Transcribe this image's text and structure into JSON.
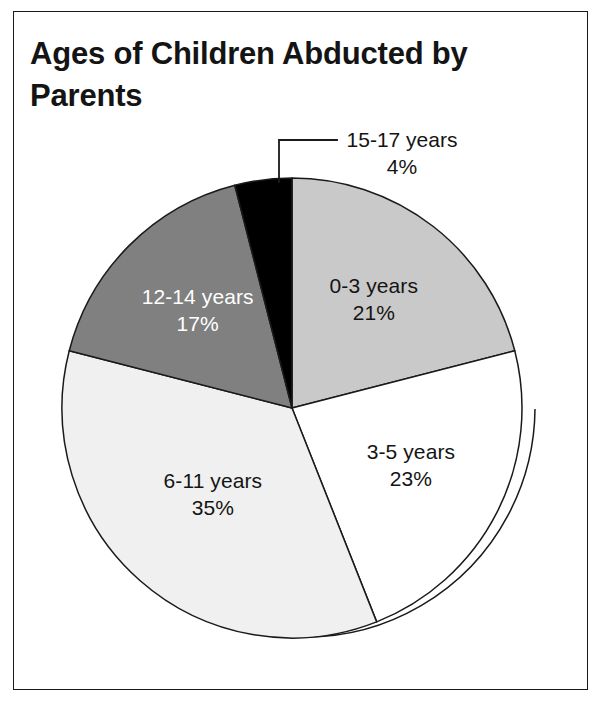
{
  "figure": {
    "title": "Ages of Children Abducted by\nParents",
    "background_color": "#ffffff",
    "frame_color": "#1a1a1a"
  },
  "chart_data": {
    "type": "pie",
    "title": "Ages of Children Abducted by Parents",
    "xlabel": "",
    "ylabel": "",
    "units": "percent",
    "value_suffix": "%",
    "total": 100,
    "start_angle_deg": 0,
    "direction": "clockwise",
    "legend": "none",
    "grid": false,
    "categories": [
      "0-3 years",
      "3-5 years",
      "6-11 years",
      "12-14 years",
      "15-17 years"
    ],
    "values": [
      21,
      23,
      35,
      17,
      4
    ],
    "slices": [
      {
        "label": "0-3 years",
        "value": 21,
        "value_text": "21%",
        "color": "#c9c9c9",
        "label_color": "#141414",
        "label_placement": "inside",
        "start_deg": 0,
        "end_deg": 75.6
      },
      {
        "label": "3-5 years",
        "value": 23,
        "value_text": "23%",
        "color": "#ffffff",
        "label_color": "#141414",
        "label_placement": "inside",
        "start_deg": 75.6,
        "end_deg": 158.4
      },
      {
        "label": "6-11 years",
        "value": 35,
        "value_text": "35%",
        "color": "#f0f0f0",
        "label_color": "#141414",
        "label_placement": "inside",
        "start_deg": 158.4,
        "end_deg": 284.4
      },
      {
        "label": "12-14 years",
        "value": 17,
        "value_text": "17%",
        "color": "#808080",
        "label_color": "#ffffff",
        "label_placement": "inside",
        "start_deg": 284.4,
        "end_deg": 345.6
      },
      {
        "label": "15-17 years",
        "value": 4,
        "value_text": "4%",
        "color": "#000000",
        "label_color": "#141414",
        "label_placement": "outside-callout",
        "start_deg": 345.6,
        "end_deg": 360
      }
    ]
  }
}
